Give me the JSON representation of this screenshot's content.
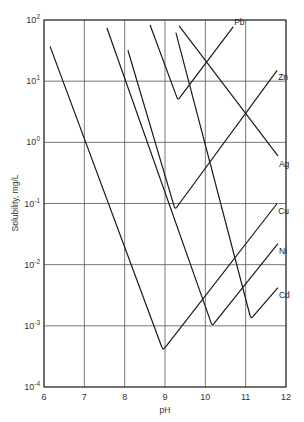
{
  "chart_data": {
    "type": "line",
    "title": "",
    "xlabel": "pH",
    "ylabel": "Solubility, mg/L",
    "xlim": [
      6,
      12
    ],
    "ylim": [
      0.0001,
      100
    ],
    "yscale": "log",
    "grid": true,
    "legend": "inline labels at line ends",
    "x_ticks": [
      "6",
      "7",
      "8",
      "9",
      "10",
      "11",
      "12"
    ],
    "y_ticks": [
      {
        "base": "10",
        "exp": "2"
      },
      {
        "base": "10",
        "exp": "1"
      },
      {
        "base": "10",
        "exp": "0"
      },
      {
        "base": "10",
        "exp": "-1"
      },
      {
        "base": "10",
        "exp": "-2"
      },
      {
        "base": "10",
        "exp": "-3"
      },
      {
        "base": "10",
        "exp": "-4"
      }
    ],
    "series": [
      {
        "name": "Pb",
        "points": [
          [
            8.63,
            83
          ],
          [
            9.32,
            4.9
          ],
          [
            10.69,
            77
          ]
        ]
      },
      {
        "name": "Zn",
        "points": [
          [
            8.08,
            32
          ],
          [
            9.25,
            0.08
          ],
          [
            11.78,
            15
          ]
        ]
      },
      {
        "name": "Ag",
        "points": [
          [
            9.35,
            80
          ],
          [
            11.8,
            0.6
          ]
        ]
      },
      {
        "name": "Cu",
        "points": [
          [
            6.15,
            37
          ],
          [
            8.95,
            0.0004
          ],
          [
            11.78,
            0.1
          ]
        ]
      },
      {
        "name": "Ni",
        "points": [
          [
            7.56,
            74
          ],
          [
            10.17,
            0.001
          ],
          [
            11.8,
            0.022
          ]
        ]
      },
      {
        "name": "Cd",
        "points": [
          [
            9.27,
            62
          ],
          [
            11.13,
            0.0013
          ],
          [
            11.8,
            0.0042
          ]
        ]
      }
    ]
  }
}
